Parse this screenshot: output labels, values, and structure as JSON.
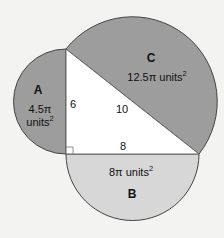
{
  "diagram": {
    "type": "pythagorean-semicircles",
    "colors": {
      "background": "#f3f3f1",
      "semicircle_dark": "#9d9d9d",
      "semicircle_light": "#d7d7d7",
      "triangle": "#ffffff",
      "stroke": "#444444"
    },
    "triangle": {
      "legs": {
        "vertical": "6",
        "horizontal": "8"
      },
      "hypotenuse": "10",
      "right_angle_marker": true
    },
    "semicircles": {
      "A": {
        "label": "A",
        "area_line1": "4.5π",
        "area_line2": "units",
        "superscript": "2",
        "on_side": "6"
      },
      "B": {
        "label": "B",
        "area": "8π units",
        "superscript": "2",
        "on_side": "8"
      },
      "C": {
        "label": "C",
        "area": "12.5π units",
        "superscript": "2",
        "on_side": "10"
      }
    }
  }
}
